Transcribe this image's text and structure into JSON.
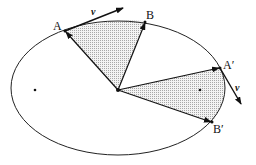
{
  "figure": {
    "labels": {
      "A": "A",
      "B": "B",
      "A_prime": "A′",
      "B_prime": "B′",
      "v_top": "v",
      "v_right": "v"
    },
    "colors": {
      "stroke": "#222222",
      "shade": "#d9d9d9",
      "background": "#ffffff"
    }
  }
}
